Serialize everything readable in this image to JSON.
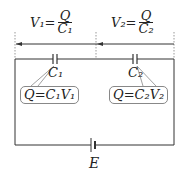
{
  "diagram": {
    "voltage_labels": [
      {
        "lhs": "V₁=",
        "num": "Q",
        "den": "C₁"
      },
      {
        "lhs": "V₂=",
        "num": "Q",
        "den": "C₂"
      }
    ],
    "capacitors": [
      {
        "label": "C₁",
        "formula": "Q=C₁V₁"
      },
      {
        "label": "C₂",
        "formula": "Q=C₂V₂"
      }
    ],
    "battery_label": "E",
    "colors": {
      "line": "#333333",
      "dotted": "#999999",
      "box_border": "#888888"
    }
  }
}
